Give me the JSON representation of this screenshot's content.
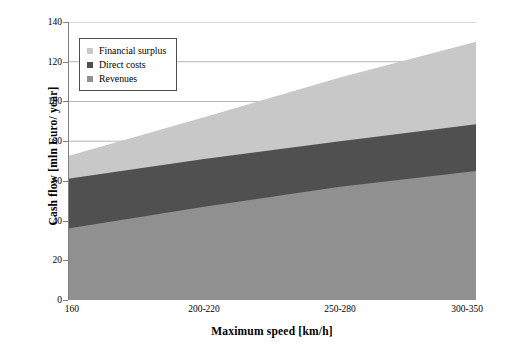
{
  "chart_data": {
    "type": "area",
    "title": "",
    "subtitle": "",
    "xlabel": "Maximum speed [km/h]",
    "ylabel": "Cash flow [mln Euro/ year]",
    "categories": [
      "160",
      "200-220",
      "250-280",
      "300-350"
    ],
    "ylim": [
      0,
      140
    ],
    "xlim_categories": 4,
    "grid": true,
    "grid_axis": "y",
    "legend_position": "top-left-inside",
    "stacked": true,
    "stack_order_bottom_to_top": [
      "Revenues",
      "Direct costs",
      "Financial surplus"
    ],
    "y_ticks": [
      0,
      20,
      40,
      60,
      80,
      100,
      120,
      140
    ],
    "series": [
      {
        "name": "Revenues",
        "color": "#909090",
        "values": [
          36,
          47,
          57,
          65
        ]
      },
      {
        "name": "Direct costs",
        "color": "#505050",
        "values": [
          25,
          24,
          23,
          23.5
        ]
      },
      {
        "name": "Financial surplus",
        "color": "#c8c8c8",
        "values": [
          11.5,
          21,
          32,
          41.5
        ]
      }
    ],
    "cumulative_tops": {
      "Revenues": [
        36,
        47,
        57,
        65
      ],
      "Direct costs": [
        61,
        71,
        80,
        88.5
      ],
      "Financial surplus": [
        72.5,
        92,
        112,
        130
      ]
    }
  },
  "legend": {
    "items": [
      {
        "label": "Financial surplus",
        "color": "#c8c8c8"
      },
      {
        "label": "Direct costs",
        "color": "#505050"
      },
      {
        "label": "Revenues",
        "color": "#909090"
      }
    ]
  },
  "axes": {
    "y_title": "Cash flow [mln Euro/ year]",
    "x_title": "Maximum speed [km/h]",
    "y_tick_labels": [
      "0",
      "20",
      "40",
      "60",
      "80",
      "100",
      "120",
      "140"
    ],
    "x_tick_labels": [
      "160",
      "200-220",
      "250-280",
      "300-350"
    ]
  },
  "colors": {
    "financial_surplus": "#c8c8c8",
    "direct_costs": "#505050",
    "revenues": "#909090",
    "gridline": "#b5b5b5",
    "axis": "#808080",
    "background": "#ffffff",
    "text": "#000000"
  }
}
